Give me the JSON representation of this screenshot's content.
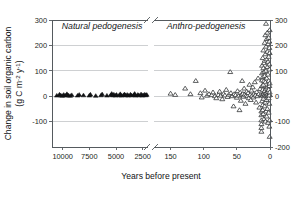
{
  "figure": {
    "background_color": "#ffffff",
    "axis_color": "#555a5e",
    "grid_color": "#b9bcbf",
    "marker_open_color": "#ffffff",
    "marker_outline_color": "#2a2c2e",
    "marker_filled_color": "#111214"
  },
  "chart_data": {
    "type": "scatter",
    "title": "",
    "xlabel": "Years before present",
    "ylabel": "Change in soil organic carbon (g C m-2 y-1)",
    "ylabel_line1": "Change in soil organic carbon",
    "ylabel_line2": "(g C m",
    "ylabel_sup1": "-2",
    "ylabel_mid": " y",
    "ylabel_sup2": "-1",
    "ylabel_end": ")",
    "ylim": [
      -200,
      300
    ],
    "yticks_left": [
      300,
      200,
      100,
      0,
      -100
    ],
    "yticks_right": [
      300,
      200,
      100,
      0,
      -100,
      -200
    ],
    "ytick_labels_left": [
      "300",
      "200",
      "100",
      "0",
      "-100"
    ],
    "ytick_labels_right": [
      "300",
      "200",
      "100",
      "0",
      "-100",
      "-200"
    ],
    "grid": true,
    "grid_axis": "y",
    "legend": "none",
    "axis_break": true,
    "axis_break_note": "x-axis is broken between 2000 and 200 years before present",
    "x_segments": [
      {
        "name": "natural-pedogenesis-segment",
        "xlim": [
          11000,
          2000
        ],
        "ticks": [
          10000,
          7500,
          5000,
          2500
        ],
        "tick_labels": [
          "10000",
          "7500",
          "5000",
          "2500"
        ],
        "reversed": true
      },
      {
        "name": "anthro-pedogenesis-segment",
        "xlim": [
          175,
          0
        ],
        "ticks": [
          150,
          100,
          50,
          0
        ],
        "tick_labels": [
          "150",
          "100",
          "50",
          "0"
        ],
        "reversed": true
      }
    ],
    "annotations": [
      {
        "name": "panel-label-natural",
        "text": "Natural pedogenesis",
        "segment": 0
      },
      {
        "name": "panel-label-anthro",
        "text": "Anthro-pedogenesis",
        "segment": 1
      }
    ],
    "series": [
      {
        "name": "Natural pedogenesis",
        "marker": "triangle-filled",
        "segment": 0,
        "points": [
          [
            10550,
            2
          ],
          [
            10300,
            6
          ],
          [
            10180,
            3
          ],
          [
            10050,
            1
          ],
          [
            9900,
            5
          ],
          [
            9750,
            2
          ],
          [
            9600,
            8
          ],
          [
            9480,
            3
          ],
          [
            9300,
            1
          ],
          [
            9150,
            4
          ],
          [
            8600,
            2
          ],
          [
            8450,
            5
          ],
          [
            8050,
            3
          ],
          [
            7500,
            2
          ],
          [
            7400,
            6
          ],
          [
            6900,
            1
          ],
          [
            6400,
            3
          ],
          [
            6300,
            7
          ],
          [
            5850,
            2
          ],
          [
            5500,
            4
          ],
          [
            5400,
            9
          ],
          [
            5300,
            3
          ],
          [
            5200,
            6
          ],
          [
            5050,
            2
          ],
          [
            4950,
            5
          ],
          [
            4700,
            3
          ],
          [
            4600,
            8
          ],
          [
            4500,
            2
          ],
          [
            4300,
            4
          ],
          [
            4200,
            7
          ],
          [
            4100,
            3
          ],
          [
            3950,
            5
          ],
          [
            3850,
            2
          ],
          [
            3650,
            6
          ],
          [
            3550,
            3
          ],
          [
            3350,
            4
          ],
          [
            3250,
            9
          ],
          [
            3150,
            2
          ],
          [
            2950,
            5
          ],
          [
            2850,
            3
          ],
          [
            2650,
            7
          ],
          [
            2550,
            2
          ],
          [
            2450,
            4
          ],
          [
            2300,
            6
          ],
          [
            2200,
            3
          ],
          [
            2120,
            5
          ]
        ]
      },
      {
        "name": "Anthro-pedogenesis",
        "marker": "triangle-open",
        "segment": 1,
        "points": [
          [
            150,
            10
          ],
          [
            143,
            5
          ],
          [
            128,
            30
          ],
          [
            120,
            8
          ],
          [
            112,
            60
          ],
          [
            105,
            12
          ],
          [
            103,
            -5
          ],
          [
            98,
            22
          ],
          [
            95,
            2
          ],
          [
            92,
            8
          ],
          [
            88,
            4
          ],
          [
            86,
            15
          ],
          [
            83,
            0
          ],
          [
            81,
            -8
          ],
          [
            78,
            5
          ],
          [
            76,
            18
          ],
          [
            74,
            2
          ],
          [
            72,
            -12
          ],
          [
            70,
            9
          ],
          [
            68,
            3
          ],
          [
            66,
            25
          ],
          [
            64,
            -3
          ],
          [
            62,
            6
          ],
          [
            60,
            95
          ],
          [
            59,
            12
          ],
          [
            57,
            0
          ],
          [
            55,
            -40
          ],
          [
            54,
            8
          ],
          [
            52,
            4
          ],
          [
            50,
            -6
          ],
          [
            49,
            20
          ],
          [
            47,
            2
          ],
          [
            46,
            -55
          ],
          [
            45,
            14
          ],
          [
            44,
            -18
          ],
          [
            43,
            5
          ],
          [
            42,
            60
          ],
          [
            41,
            9
          ],
          [
            40,
            -2
          ],
          [
            39,
            30
          ],
          [
            38,
            7
          ],
          [
            37,
            -30
          ],
          [
            36,
            3
          ],
          [
            35,
            18
          ],
          [
            34,
            0
          ],
          [
            33,
            12
          ],
          [
            32,
            -8
          ],
          [
            31,
            45
          ],
          [
            30,
            5
          ],
          [
            29,
            -15
          ],
          [
            28,
            22
          ],
          [
            27,
            2
          ],
          [
            26,
            35
          ],
          [
            25,
            -5
          ],
          [
            24,
            10
          ],
          [
            23,
            55
          ],
          [
            22,
            3
          ],
          [
            21,
            -25
          ],
          [
            20,
            16
          ],
          [
            19,
            0
          ],
          [
            18,
            70
          ],
          [
            17,
            8
          ],
          [
            16,
            -45
          ],
          [
            15,
            28
          ],
          [
            14,
            5
          ],
          [
            13,
            -110
          ],
          [
            13,
            -125
          ],
          [
            13,
            -140
          ],
          [
            13,
            -75
          ],
          [
            13,
            -60
          ],
          [
            13,
            -95
          ],
          [
            12,
            40
          ],
          [
            12,
            90
          ],
          [
            12,
            120
          ],
          [
            12,
            5
          ],
          [
            12,
            -20
          ],
          [
            12,
            62
          ],
          [
            11,
            150
          ],
          [
            11,
            2
          ],
          [
            11,
            -35
          ],
          [
            11,
            75
          ],
          [
            11,
            25
          ],
          [
            11,
            -55
          ],
          [
            10,
            110
          ],
          [
            10,
            8
          ],
          [
            10,
            -70
          ],
          [
            10,
            45
          ],
          [
            10,
            180
          ],
          [
            10,
            -10
          ],
          [
            9,
            130
          ],
          [
            9,
            15
          ],
          [
            9,
            -90
          ],
          [
            9,
            60
          ],
          [
            9,
            0
          ],
          [
            9,
            95
          ],
          [
            8,
            210
          ],
          [
            8,
            20
          ],
          [
            8,
            -40
          ],
          [
            8,
            80
          ],
          [
            8,
            5
          ],
          [
            8,
            140
          ],
          [
            7,
            240
          ],
          [
            7,
            10
          ],
          [
            7,
            -100
          ],
          [
            7,
            55
          ],
          [
            7,
            165
          ],
          [
            7,
            -25
          ],
          [
            6,
            285
          ],
          [
            6,
            30
          ],
          [
            6,
            100
          ],
          [
            6,
            -60
          ],
          [
            6,
            195
          ],
          [
            6,
            2
          ],
          [
            5,
            225
          ],
          [
            5,
            12
          ],
          [
            5,
            -80
          ],
          [
            5,
            70
          ],
          [
            5,
            145
          ],
          [
            5,
            -15
          ],
          [
            4,
            250
          ],
          [
            4,
            35
          ],
          [
            4,
            -50
          ],
          [
            4,
            115
          ],
          [
            4,
            5
          ],
          [
            4,
            175
          ],
          [
            3,
            205
          ],
          [
            3,
            18
          ],
          [
            3,
            -105
          ],
          [
            3,
            85
          ],
          [
            3,
            0
          ],
          [
            3,
            135
          ],
          [
            2,
            230
          ],
          [
            2,
            25
          ],
          [
            2,
            -65
          ],
          [
            2,
            60
          ],
          [
            2,
            155
          ],
          [
            2,
            -8
          ],
          [
            1,
            190
          ],
          [
            1,
            8
          ],
          [
            1,
            -120
          ],
          [
            1,
            105
          ],
          [
            1,
            40
          ],
          [
            1,
            125
          ],
          [
            1,
            -30
          ],
          [
            1,
            215
          ],
          [
            1,
            3
          ],
          [
            0.5,
            260
          ],
          [
            0.5,
            -160
          ],
          [
            0.5,
            50
          ],
          [
            0.5,
            15
          ],
          [
            0.5,
            -95
          ],
          [
            0.5,
            170
          ]
        ]
      }
    ]
  }
}
